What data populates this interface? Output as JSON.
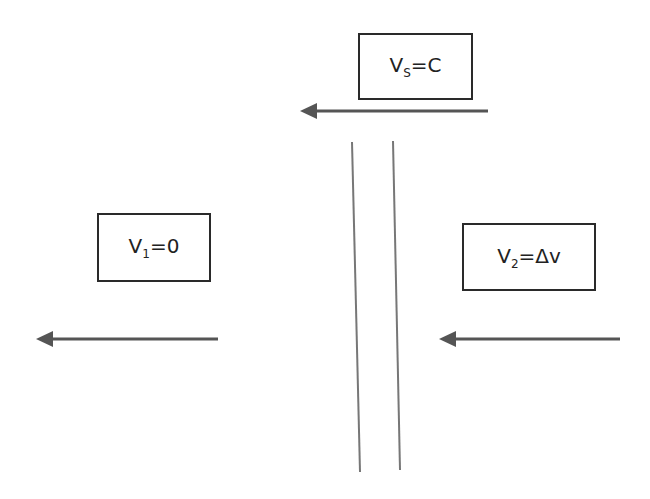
{
  "diagram": {
    "boxes": [
      {
        "id": "source",
        "var": "V",
        "sub": "S",
        "rest": "=C"
      },
      {
        "id": "left",
        "var": "V",
        "sub": "1",
        "rest": "=0"
      },
      {
        "id": "right",
        "var": "V",
        "sub": "2",
        "rest": "=Δv"
      }
    ],
    "arrows": [
      {
        "id": "source-arrow",
        "direction": "left"
      },
      {
        "id": "left-arrow",
        "direction": "left"
      },
      {
        "id": "right-arrow",
        "direction": "left"
      }
    ],
    "colors": {
      "line": "#555555",
      "arrow": "#555555",
      "border": "#2a2a2a"
    }
  }
}
